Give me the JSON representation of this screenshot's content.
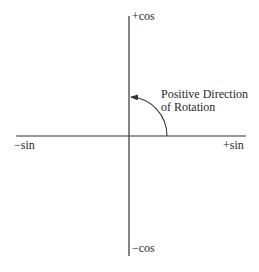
{
  "diagram": {
    "title": "",
    "axes": {
      "positive_vertical_label": "+cos",
      "negative_vertical_label": "−cos",
      "positive_horizontal_label": "+sin",
      "negative_horizontal_label": "−sin"
    },
    "rotation_annotation": {
      "line1": "Positive Direction",
      "line2": "of Rotation",
      "direction": "counterclockwise",
      "from_axis": "+sin",
      "to_axis": "+cos"
    },
    "colors": {
      "line": "#333333",
      "text": "#2a2a2a",
      "background": "#ffffff"
    }
  }
}
